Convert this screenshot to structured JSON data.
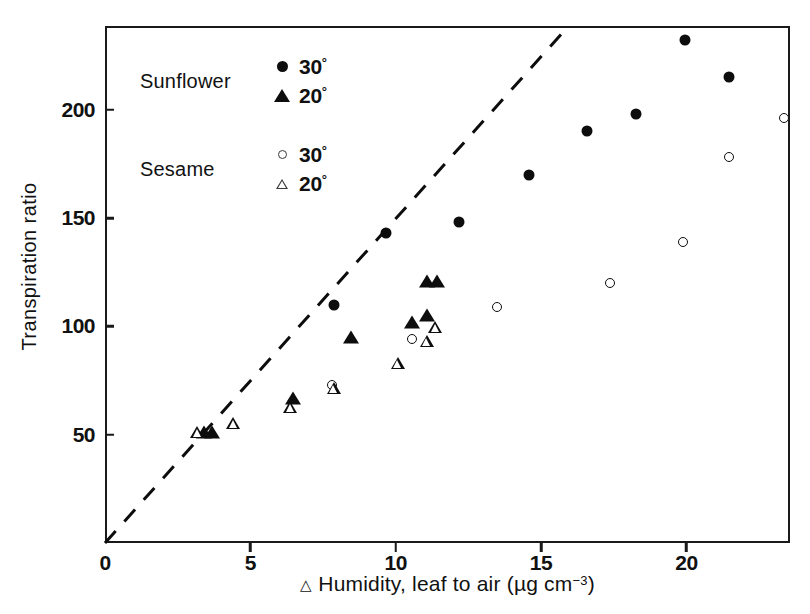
{
  "chart_data": {
    "type": "scatter",
    "title": "",
    "xlabel": "△ Humidity, leaf to air (µg cm⁻³)",
    "ylabel": "Transpiration ratio",
    "xlim": [
      0,
      23.6
    ],
    "ylim": [
      0,
      238
    ],
    "xticks": [
      0,
      5,
      10,
      15,
      20
    ],
    "yticks": [
      50,
      100,
      150,
      200
    ],
    "grid": false,
    "legend_position": "upper-left-inside",
    "series": [
      {
        "name": "Sunflower 30°",
        "marker": "filled-circle",
        "points": [
          [
            7.8,
            111
          ],
          [
            9.6,
            144
          ],
          [
            12.1,
            149
          ],
          [
            14.5,
            171
          ],
          [
            16.5,
            191
          ],
          [
            18.2,
            199
          ],
          [
            19.9,
            233
          ],
          [
            21.4,
            216
          ]
        ]
      },
      {
        "name": "Sunflower 20°",
        "marker": "filled-triangle",
        "points": [
          [
            3.35,
            52
          ],
          [
            3.6,
            52
          ],
          [
            6.4,
            68
          ],
          [
            8.4,
            96
          ],
          [
            10.5,
            103
          ],
          [
            11.0,
            106
          ],
          [
            11.0,
            122
          ],
          [
            11.35,
            122
          ]
        ]
      },
      {
        "name": "Sesame 30°",
        "marker": "open-circle",
        "points": [
          [
            7.75,
            74
          ],
          [
            10.5,
            95
          ],
          [
            13.4,
            110
          ],
          [
            17.3,
            121
          ],
          [
            19.8,
            140
          ],
          [
            21.4,
            179
          ],
          [
            23.3,
            197
          ]
        ]
      },
      {
        "name": "Sesame 20°",
        "marker": "open-triangle",
        "points": [
          [
            3.1,
            52
          ],
          [
            4.35,
            62
          ],
          [
            6.3,
            75
          ],
          [
            7.8,
            89
          ],
          [
            10.0,
            106
          ],
          [
            11.0,
            122
          ],
          [
            11.3,
            134
          ]
        ]
      }
    ],
    "reference_line": {
      "style": "dashed",
      "from": [
        0,
        0
      ],
      "to": [
        15.9,
        238
      ],
      "description": "dashed line through origin"
    }
  },
  "axes": {
    "y_tick_labels": [
      "200",
      "150",
      "100",
      "50"
    ],
    "x_tick_labels": [
      "0",
      "5",
      "10",
      "15",
      "20"
    ],
    "y_axis_title": "Transpiration ratio",
    "x_axis_title_symbol": "△",
    "x_axis_title_main": " Humidity, leaf to air (µg cm",
    "x_axis_title_exp": "−3",
    "x_axis_title_tail": ")"
  },
  "legend": {
    "groups": [
      {
        "name": "Sunflower",
        "rows": [
          {
            "marker": "filled-circle",
            "label": "30",
            "degree": "°"
          },
          {
            "marker": "filled-triangle",
            "label": "20",
            "degree": "°"
          }
        ]
      },
      {
        "name": "Sesame",
        "rows": [
          {
            "marker": "open-circle",
            "label": "30",
            "degree": "°"
          },
          {
            "marker": "open-triangle",
            "label": "20",
            "degree": "°"
          }
        ]
      }
    ]
  },
  "colors": {
    "ink": "#0d0d0d",
    "axis": "#1a1a1a",
    "background": "#ffffff"
  }
}
